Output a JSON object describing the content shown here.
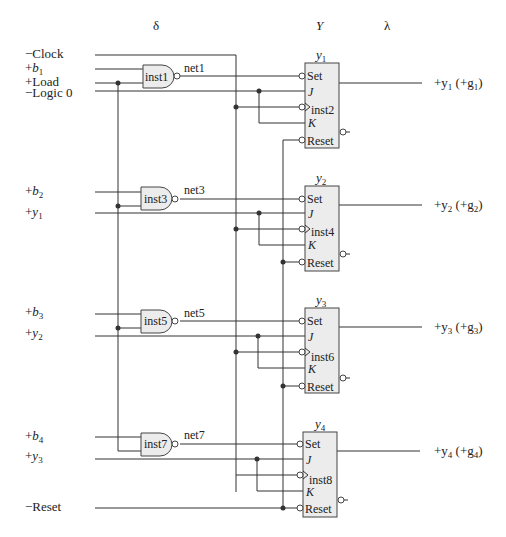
{
  "header": {
    "delta": "δ",
    "Y": "Y",
    "lambda": "λ"
  },
  "inputs": {
    "clock": "−Clock",
    "b1_sign": "+",
    "b1": "b",
    "b1_sub": "1",
    "load": "+Load",
    "logic0": "−Logic 0",
    "b2_sign": "+",
    "b2": "b",
    "b2_sub": "2",
    "y1_sign": "+",
    "y1": "y",
    "y1_sub": "1",
    "b3_sign": "+",
    "b3": "b",
    "b3_sub": "3",
    "y2_sign": "+",
    "y2": "y",
    "y2_sub": "2",
    "b4_sign": "+",
    "b4": "b",
    "b4_sub": "4",
    "y3_sign": "+",
    "y3": "y",
    "y3_sub": "3",
    "reset": "−Reset"
  },
  "gates": [
    {
      "name": "inst1",
      "net": "net1"
    },
    {
      "name": "inst3",
      "net": "net3"
    },
    {
      "name": "inst5",
      "net": "net5"
    },
    {
      "name": "inst7",
      "net": "net7"
    }
  ],
  "flipflops": [
    {
      "title": "y",
      "title_sub": "1",
      "inst": "inst2",
      "set": "Set",
      "j": "J",
      "k": "K",
      "reset": "Reset",
      "out_prefix": "+y",
      "out_sub": "1",
      "out_mid": " (+g",
      "out_sub2": "1",
      "out_suffix": ")"
    },
    {
      "title": "y",
      "title_sub": "2",
      "inst": "inst4",
      "set": "Set",
      "j": "J",
      "k": "K",
      "reset": "Reset",
      "out_prefix": "+y",
      "out_sub": "2",
      "out_mid": " (+g",
      "out_sub2": "2",
      "out_suffix": ")"
    },
    {
      "title": "y",
      "title_sub": "3",
      "inst": "inst6",
      "set": "Set",
      "j": "J",
      "k": "K",
      "reset": "Reset",
      "out_prefix": "+y",
      "out_sub": "3",
      "out_mid": " (+g",
      "out_sub2": "3",
      "out_suffix": ")"
    },
    {
      "title": "y",
      "title_sub": "4",
      "inst": "inst8",
      "set": "Set",
      "j": "J",
      "k": "K",
      "reset": "Reset",
      "out_prefix": "+y",
      "out_sub": "4",
      "out_mid": " (+g",
      "out_sub2": "4",
      "out_suffix": ")"
    }
  ],
  "qbar_mark": "−"
}
